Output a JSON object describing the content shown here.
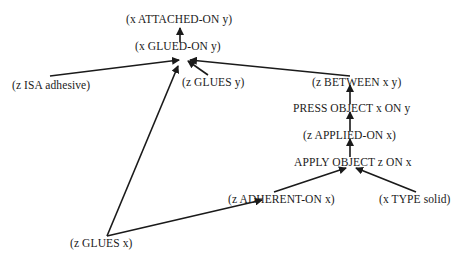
{
  "diagram": {
    "type": "inference-graph",
    "nodes": {
      "attached_on": "(x ATTACHED-ON y)",
      "glued_on": "(x GLUED-ON y)",
      "isa_adhesive": "(z  ISA  adhesive)",
      "glues_y": "(z GLUES y)",
      "between": "(z BETWEEN x y)",
      "press_object": "PRESS OBJECT x ON y",
      "applied_on": "(z  APPLIED-ON  x)",
      "apply_object": "APPLY OBJECT z ON x",
      "adherent_on": "(z ADHERENT-ON x)",
      "type_solid": "(x  TYPE  solid)",
      "glues_x": "(z GLUES  x)"
    },
    "edges": [
      {
        "from": "glued_on",
        "to": "attached_on"
      },
      {
        "from": "isa_adhesive",
        "to": "glued_on"
      },
      {
        "from": "glues_y",
        "to": "glued_on"
      },
      {
        "from": "glues_x",
        "to": "glued_on"
      },
      {
        "from": "between",
        "to": "glued_on"
      },
      {
        "from": "press_object",
        "to": "between"
      },
      {
        "from": "applied_on",
        "to": "press_object"
      },
      {
        "from": "apply_object",
        "to": "applied_on"
      },
      {
        "from": "adherent_on",
        "to": "apply_object"
      },
      {
        "from": "type_solid",
        "to": "apply_object"
      },
      {
        "from": "glues_x",
        "to": "adherent_on"
      }
    ],
    "colors": {
      "ink": "#1a1a1a",
      "background": "#ffffff"
    }
  }
}
